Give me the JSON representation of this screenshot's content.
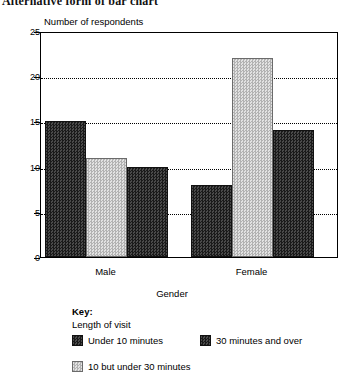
{
  "document": {
    "heading": "Alternative form of bar chart"
  },
  "chart_data": {
    "type": "bar",
    "title": "",
    "ylabel": "Number of respondents",
    "xlabel": "Gender",
    "categories": [
      "Male",
      "Female"
    ],
    "series": [
      {
        "name": "Under 10 minutes",
        "style": "dark",
        "values": [
          15,
          8
        ]
      },
      {
        "name": "10 but under 30 minutes",
        "style": "light",
        "values": [
          11,
          22
        ]
      },
      {
        "name": "30 minutes and over",
        "style": "dark",
        "values": [
          10,
          14
        ]
      }
    ],
    "ylim": [
      0,
      25
    ],
    "yticks": [
      0,
      5,
      10,
      15,
      20,
      25
    ],
    "ytick_labels": [
      "0",
      "5",
      "10",
      "15",
      "20",
      "25"
    ],
    "grid": "horizontal-dotted",
    "legend_position": "below",
    "colors": {
      "dark": "#2c2c2c",
      "light": "#c9c9c9",
      "axis": "#000000",
      "background": "#ffffff"
    }
  },
  "key": {
    "title": "Key:",
    "subtitle": "Length of visit",
    "entries": [
      {
        "label": "Under 10 minutes",
        "style": "dark"
      },
      {
        "label": "30 minutes and over",
        "style": "dark"
      },
      {
        "label": "10 but under 30 minutes",
        "style": "light"
      }
    ]
  }
}
